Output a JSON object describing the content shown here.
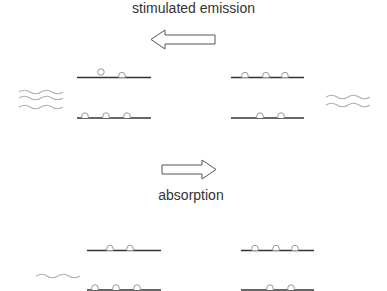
{
  "labels": {
    "stimulated_emission": "stimulated emission",
    "absorption": "absorption"
  },
  "colors": {
    "level_line": "#333333",
    "atom": "#999999",
    "photon": "#b0b0b0",
    "arrow": "#555555",
    "text": "#333333"
  },
  "panels": [
    {
      "name": "stimulated-emission-left",
      "upper_level_atoms": 2,
      "upper_level_excited_floating": 1,
      "lower_level_atoms": 3,
      "photons": 3
    },
    {
      "name": "stimulated-emission-right",
      "upper_level_atoms": 3,
      "lower_level_atoms": 2,
      "photons": 2
    },
    {
      "name": "absorption-left",
      "upper_level_atoms": 2,
      "lower_level_atoms": 3,
      "photons": 1
    },
    {
      "name": "absorption-right",
      "upper_level_atoms": 3,
      "lower_level_atoms": 2,
      "photons": 0
    }
  ],
  "arrows": [
    {
      "name": "stimulated-emission-arrow",
      "direction": "left"
    },
    {
      "name": "absorption-arrow",
      "direction": "right"
    }
  ]
}
